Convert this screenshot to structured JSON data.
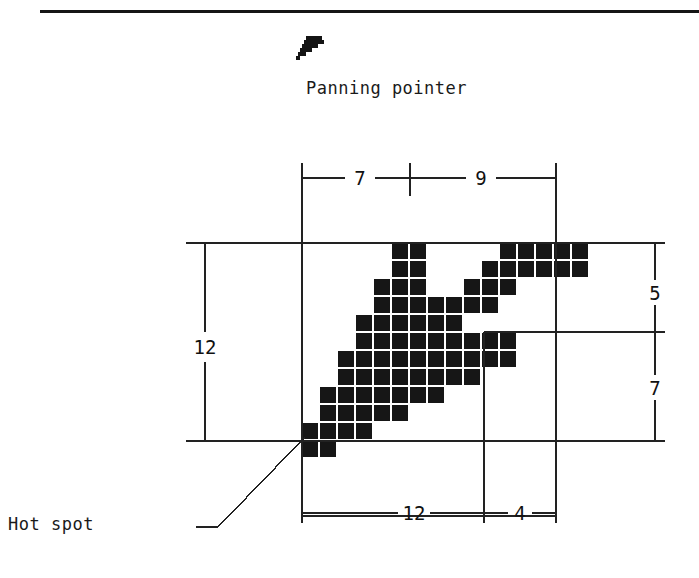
{
  "figure": {
    "top_rule": true,
    "pointer_icon": "panning-pointer-icon",
    "caption": "Panning pointer",
    "hot_spot_label": "Hot spot"
  },
  "dimensions": {
    "top_left": "7",
    "top_right": "9",
    "left": "12",
    "right_top": "5",
    "right_bottom": "7",
    "bottom_left": "12",
    "bottom_right": "4"
  },
  "chart_data": {
    "type": "heatmap",
    "title": "Panning pointer",
    "xlabel": "",
    "ylabel": "",
    "grid_cols": 16,
    "grid_rows": 12,
    "cell_px": 18,
    "origin_x": 302,
    "origin_y": 243,
    "colors": {
      "on": "#161616",
      "off": "#ffffff",
      "hotspot": "#555555"
    },
    "hotspot": {
      "col": 0,
      "row": 11
    },
    "legend": [
      "filled pixel",
      "hot spot (dithered)"
    ],
    "rows": [
      [
        0,
        0,
        0,
        0,
        0,
        1,
        1,
        0,
        0,
        0,
        0,
        1,
        1,
        1,
        1,
        1
      ],
      [
        0,
        0,
        0,
        0,
        0,
        1,
        1,
        0,
        0,
        0,
        1,
        1,
        1,
        1,
        1,
        1
      ],
      [
        0,
        0,
        0,
        0,
        1,
        1,
        1,
        0,
        0,
        1,
        1,
        1,
        0,
        0,
        0,
        0
      ],
      [
        0,
        0,
        0,
        0,
        1,
        1,
        1,
        1,
        1,
        1,
        1,
        0,
        0,
        0,
        0,
        0
      ],
      [
        0,
        0,
        0,
        1,
        1,
        1,
        1,
        1,
        1,
        0,
        0,
        0,
        0,
        0,
        0,
        0
      ],
      [
        0,
        0,
        0,
        1,
        1,
        1,
        1,
        1,
        1,
        1,
        1,
        1,
        0,
        0,
        0,
        0
      ],
      [
        0,
        0,
        1,
        1,
        1,
        1,
        1,
        1,
        1,
        1,
        1,
        1,
        0,
        0,
        0,
        0
      ],
      [
        0,
        0,
        1,
        1,
        1,
        1,
        1,
        1,
        1,
        1,
        0,
        0,
        0,
        0,
        0,
        0
      ],
      [
        0,
        1,
        1,
        1,
        1,
        1,
        1,
        1,
        0,
        0,
        0,
        0,
        0,
        0,
        0,
        0
      ],
      [
        0,
        1,
        1,
        1,
        1,
        1,
        0,
        0,
        0,
        0,
        0,
        0,
        0,
        0,
        0,
        0
      ],
      [
        1,
        1,
        1,
        1,
        0,
        0,
        0,
        0,
        0,
        0,
        0,
        0,
        0,
        0,
        0,
        0
      ],
      [
        2,
        1,
        0,
        0,
        0,
        0,
        0,
        0,
        0,
        0,
        0,
        0,
        0,
        0,
        0,
        0
      ]
    ]
  }
}
